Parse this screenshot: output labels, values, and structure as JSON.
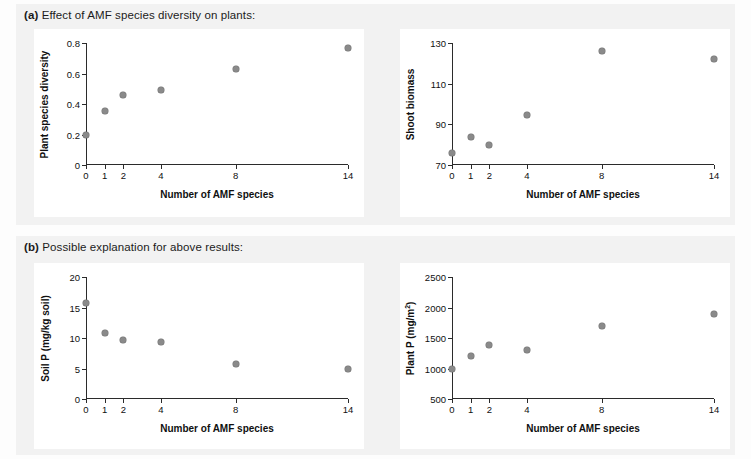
{
  "figure": {
    "background_color": "#fdfdfd",
    "panel_background_color": "#f2f2f2",
    "plot_background_color": "#ffffff",
    "marker_color": "#8a8a8a",
    "axis_color": "#2b2b2b"
  },
  "panels": [
    {
      "tag": "(a)",
      "caption": "Effect of AMF species diversity on plants:"
    },
    {
      "tag": "(b)",
      "caption": "Possible explanation for above results:"
    }
  ],
  "chart_data": [
    {
      "type": "scatter",
      "panel": "(a)",
      "position": "top-left",
      "title": "",
      "xlabel": "Number of AMF species",
      "ylabel": "Plant species diversity",
      "x": [
        0,
        1,
        2,
        4,
        8,
        14
      ],
      "values": [
        0.2,
        0.355,
        0.46,
        0.495,
        0.63,
        0.765
      ],
      "xlim": [
        0,
        14
      ],
      "ylim": [
        0,
        0.8
      ],
      "xticks": [
        0,
        1,
        2,
        4,
        8,
        14
      ],
      "xticklabels": [
        "0",
        "1",
        "2",
        "4",
        "8",
        "14"
      ],
      "yticks": [
        0,
        0.2,
        0.4,
        0.6,
        0.8
      ],
      "yticklabels": [
        "0",
        "0.2",
        "0.4",
        "0.6",
        "0.8"
      ],
      "grid": false,
      "legend": "none"
    },
    {
      "type": "scatter",
      "panel": "(a)",
      "position": "top-right",
      "title": "",
      "xlabel": "Number of AMF species",
      "ylabel": "Shoot biomass",
      "x": [
        0,
        1,
        2,
        4,
        8,
        14
      ],
      "values": [
        76,
        84,
        80,
        94.5,
        126,
        122
      ],
      "xlim": [
        0,
        14
      ],
      "ylim": [
        70,
        130
      ],
      "xticks": [
        0,
        1,
        2,
        4,
        8,
        14
      ],
      "xticklabels": [
        "0",
        "1",
        "2",
        "4",
        "8",
        "14"
      ],
      "yticks": [
        70,
        90,
        110,
        130
      ],
      "yticklabels": [
        "70",
        "90",
        "110",
        "130"
      ],
      "grid": false,
      "legend": "none"
    },
    {
      "type": "scatter",
      "panel": "(b)",
      "position": "bottom-left",
      "title": "",
      "xlabel": "Number of AMF species",
      "ylabel": "Soil P (mg/kg soil)",
      "x": [
        0,
        1,
        2,
        4,
        8,
        14
      ],
      "values": [
        15.8,
        10.8,
        9.6,
        9.3,
        5.8,
        5.0
      ],
      "xlim": [
        0,
        14
      ],
      "ylim": [
        0,
        20
      ],
      "xticks": [
        0,
        1,
        2,
        4,
        8,
        14
      ],
      "xticklabels": [
        "0",
        "1",
        "2",
        "4",
        "8",
        "14"
      ],
      "yticks": [
        0,
        5,
        10,
        15,
        20
      ],
      "yticklabels": [
        "0",
        "5",
        "10",
        "15",
        "20"
      ],
      "grid": false,
      "legend": "none"
    },
    {
      "type": "scatter",
      "panel": "(b)",
      "position": "bottom-right",
      "title": "",
      "xlabel": "Number of AMF species",
      "ylabel": "Plant P (mg/m2)",
      "ylabel_html": "Plant P (mg/m<sup>2</sup>)",
      "x": [
        0,
        1,
        2,
        4,
        8,
        14
      ],
      "values": [
        1000,
        1210,
        1380,
        1305,
        1690,
        1900
      ],
      "xlim": [
        0,
        14
      ],
      "ylim": [
        500,
        2500
      ],
      "xticks": [
        0,
        1,
        2,
        4,
        8,
        14
      ],
      "xticklabels": [
        "0",
        "1",
        "2",
        "4",
        "8",
        "14"
      ],
      "yticks": [
        500,
        1000,
        1500,
        2000,
        2500
      ],
      "yticklabels": [
        "500",
        "1000",
        "1500",
        "2000",
        "2500"
      ],
      "grid": false,
      "legend": "none"
    }
  ]
}
